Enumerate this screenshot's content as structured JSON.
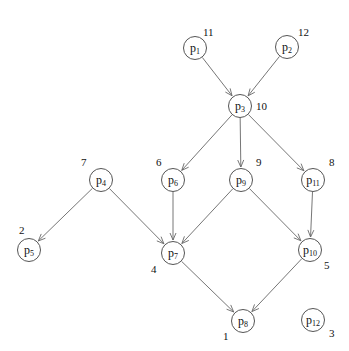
{
  "diagram": {
    "type": "directed-graph",
    "nodes": [
      {
        "id": "p1",
        "base": "p",
        "sub": "1",
        "x": 195,
        "y": 48,
        "number": "11",
        "num_dx": 8,
        "num_dy": -22
      },
      {
        "id": "p2",
        "base": "p",
        "sub": "2",
        "x": 287,
        "y": 47,
        "number": "12",
        "num_dx": 11,
        "num_dy": -21
      },
      {
        "id": "p3",
        "base": "p",
        "sub": "3",
        "x": 240,
        "y": 106,
        "number": "10",
        "num_dx": 16,
        "num_dy": -6
      },
      {
        "id": "p4",
        "base": "p",
        "sub": "4",
        "x": 101,
        "y": 180,
        "number": "7",
        "num_dx": -20,
        "num_dy": -24
      },
      {
        "id": "p5",
        "base": "p",
        "sub": "5",
        "x": 29,
        "y": 250,
        "number": "2",
        "num_dx": -10,
        "num_dy": -26
      },
      {
        "id": "p6",
        "base": "p",
        "sub": "6",
        "x": 173,
        "y": 180,
        "number": "6",
        "num_dx": -17,
        "num_dy": -24
      },
      {
        "id": "p7",
        "base": "p",
        "sub": "7",
        "x": 173,
        "y": 253,
        "number": "4",
        "num_dx": -22,
        "num_dy": 10
      },
      {
        "id": "p8",
        "base": "p",
        "sub": "8",
        "x": 243,
        "y": 321,
        "number": "1",
        "num_dx": -20,
        "num_dy": 9
      },
      {
        "id": "p9",
        "base": "p",
        "sub": "9",
        "x": 241,
        "y": 180,
        "number": "9",
        "num_dx": 15,
        "num_dy": -24
      },
      {
        "id": "p10",
        "base": "p",
        "sub": "10",
        "x": 310,
        "y": 250,
        "number": "5",
        "num_dx": 14,
        "num_dy": 9
      },
      {
        "id": "p11",
        "base": "p",
        "sub": "11",
        "x": 313,
        "y": 180,
        "number": "8",
        "num_dx": 16,
        "num_dy": -24
      },
      {
        "id": "p12",
        "base": "p",
        "sub": "12",
        "x": 313,
        "y": 320,
        "number": "3",
        "num_dx": 16,
        "num_dy": 7
      }
    ],
    "edges": [
      {
        "from": "p1",
        "to": "p3"
      },
      {
        "from": "p2",
        "to": "p3"
      },
      {
        "from": "p3",
        "to": "p6"
      },
      {
        "from": "p3",
        "to": "p9"
      },
      {
        "from": "p3",
        "to": "p11"
      },
      {
        "from": "p4",
        "to": "p5"
      },
      {
        "from": "p4",
        "to": "p7"
      },
      {
        "from": "p6",
        "to": "p7"
      },
      {
        "from": "p9",
        "to": "p7"
      },
      {
        "from": "p9",
        "to": "p10"
      },
      {
        "from": "p11",
        "to": "p10"
      },
      {
        "from": "p7",
        "to": "p8"
      },
      {
        "from": "p10",
        "to": "p8"
      }
    ],
    "colors": {
      "edge": "#666666",
      "node_border": "#555555",
      "text": "#111111"
    },
    "node_radius": 12
  }
}
